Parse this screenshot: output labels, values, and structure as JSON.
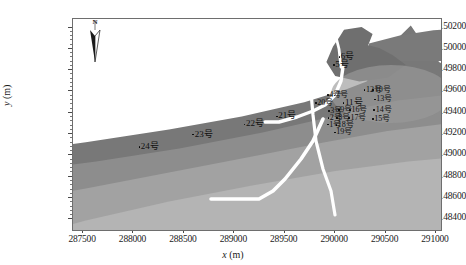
{
  "figure": {
    "title": "",
    "north_arrow_label": "N",
    "units": "m"
  },
  "axes": {
    "x_title_var": "x",
    "x_title_unit": "(m)",
    "y_title_var": "y",
    "y_title_unit": "(m)",
    "x_ticks": [
      "287500",
      "288000",
      "288500",
      "289000",
      "289500",
      "290000",
      "290500",
      "291000"
    ],
    "y_ticks": [
      "9148400",
      "9148600",
      "9148800",
      "9149000",
      "9149200",
      "9149400",
      "9149600",
      "9149800",
      "9150000",
      "9150200"
    ]
  },
  "colors": {
    "frame": "#6e6e6e",
    "background": "#ffffff",
    "band_dark": "#787878",
    "band_mid": "#8d8d8d",
    "band_light": "#a2a2a2",
    "band_pale": "#b4b4b4",
    "linework": "#ffffff",
    "label_text": "#101010"
  },
  "chart_data": {
    "type": "scatter",
    "title": "",
    "xlabel": "x (m)",
    "ylabel": "y (m)",
    "xlim": [
      287400,
      291050
    ],
    "ylim": [
      9148300,
      9150280
    ],
    "grid": false,
    "legend": "none",
    "annotation_note": "Grayscale shaded-relief terrain map with white road/river polylines and numbered survey points",
    "points": [
      {
        "label": "1号",
        "x": 289930,
        "y": 9149290
      },
      {
        "label": "2号",
        "x": 289935,
        "y": 9149355
      },
      {
        "label": "3号",
        "x": 289940,
        "y": 9149420
      },
      {
        "label": "4号",
        "x": 289930,
        "y": 9149570
      },
      {
        "label": "5号",
        "x": 289990,
        "y": 9149855
      },
      {
        "label": "6号",
        "x": 290045,
        "y": 9149930
      },
      {
        "label": "7号",
        "x": 289995,
        "y": 9149565
      },
      {
        "label": "8号",
        "x": 290020,
        "y": 9149355
      },
      {
        "label": "9号",
        "x": 290040,
        "y": 9149425
      },
      {
        "label": "10号",
        "x": 290380,
        "y": 9149615
      },
      {
        "label": "11号",
        "x": 290085,
        "y": 9149500
      },
      {
        "label": "12号",
        "x": 290295,
        "y": 9149615
      },
      {
        "label": "13号",
        "x": 290395,
        "y": 9149525
      },
      {
        "label": "14号",
        "x": 290390,
        "y": 9149430
      },
      {
        "label": "15号",
        "x": 290375,
        "y": 9149345
      },
      {
        "label": "16号",
        "x": 290150,
        "y": 9149425
      },
      {
        "label": "17号",
        "x": 290140,
        "y": 9149355
      },
      {
        "label": "18号",
        "x": 290015,
        "y": 9149285
      },
      {
        "label": "19号",
        "x": 290000,
        "y": 9149215
      },
      {
        "label": "20号",
        "x": 289810,
        "y": 9149495
      },
      {
        "label": "21号",
        "x": 289425,
        "y": 9149375
      },
      {
        "label": "22号",
        "x": 289105,
        "y": 9149300
      },
      {
        "label": "23号",
        "x": 288595,
        "y": 9149205
      },
      {
        "label": "24号",
        "x": 288060,
        "y": 9149085
      }
    ]
  }
}
